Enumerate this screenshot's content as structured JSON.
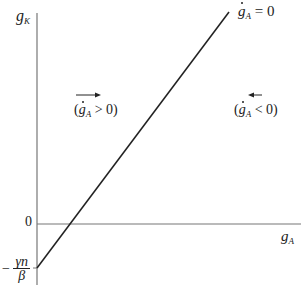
{
  "diagram": {
    "y_axis_label_main": "g",
    "y_axis_label_sub": "K",
    "x_axis_label_main": "g",
    "x_axis_label_sub": "A",
    "line_label_var": "g",
    "line_label_sub": "A",
    "line_label_eq": " = 0",
    "origin_label": "0",
    "intercept_label": {
      "sign": "−",
      "numerator": "γn",
      "denominator": "β"
    },
    "left_region": {
      "arrow_direction": "right",
      "open": "(",
      "var": "g",
      "sub": "A",
      "rel": " > 0)"
    },
    "right_region": {
      "arrow_direction": "left",
      "open": "(",
      "var": "g",
      "sub": "A",
      "rel": " < 0)"
    },
    "colors": {
      "axis": "#777777",
      "line": "#222222",
      "text": "#222222"
    }
  }
}
